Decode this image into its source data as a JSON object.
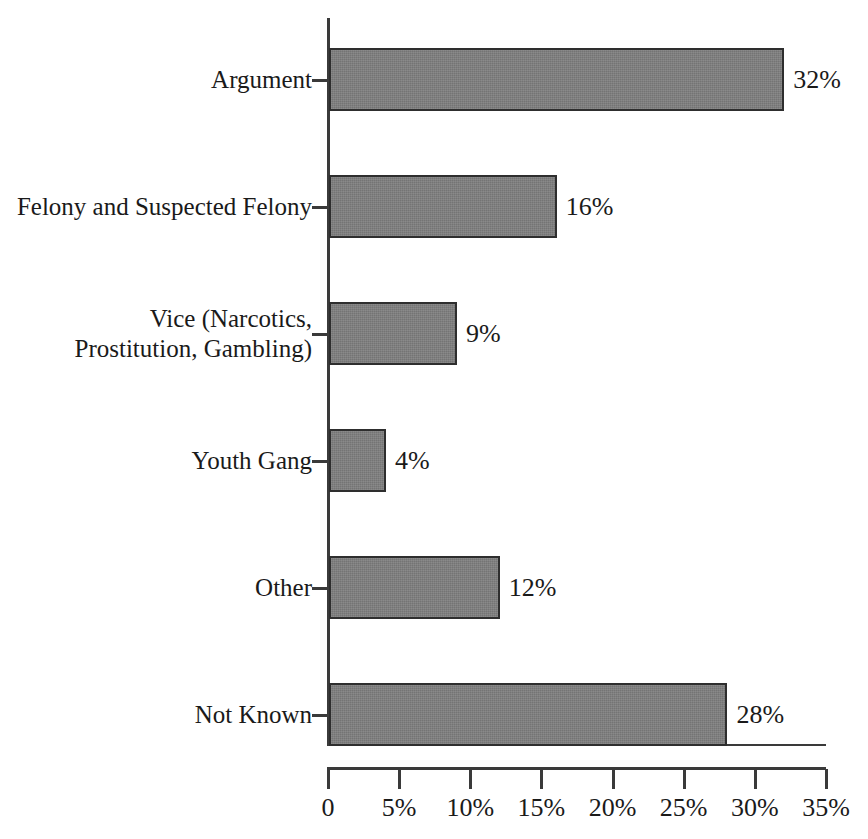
{
  "chart_data": {
    "type": "bar",
    "orientation": "horizontal",
    "title": "",
    "subtitle": "",
    "xlabel": "",
    "ylabel": "",
    "categories": [
      "Argument",
      "Felony and Suspected Felony",
      "Vice (Narcotics, Prostitution, Gambling)",
      "Youth Gang",
      "Other",
      "Not Known"
    ],
    "values": [
      32,
      16,
      9,
      4,
      12,
      28
    ],
    "value_labels": [
      "32%",
      "16%",
      "9%",
      "4%",
      "12%",
      "28%"
    ],
    "xlim": [
      0,
      35
    ],
    "xticks": [
      0,
      5,
      10,
      15,
      20,
      25,
      30,
      35
    ],
    "xtick_labels": [
      "0",
      "5%",
      "10%",
      "15%",
      "20%",
      "25%",
      "30%",
      "35%"
    ],
    "grid": false,
    "legend": false,
    "bar_color": "#7d7d7d",
    "bar_edge_color": "#2e2e2e",
    "axis_color": "#3a3a3a",
    "background_color": "#ffffff"
  },
  "bars": [
    {
      "label": "Argument",
      "label_line1": "Argument",
      "label_line2": "",
      "value": 32,
      "value_label": "32%"
    },
    {
      "label": "Felony and Suspected Felony",
      "label_line1": "Felony and Suspected Felony",
      "label_line2": "",
      "value": 16,
      "value_label": "16%"
    },
    {
      "label": "Vice (Narcotics, Prostitution, Gambling)",
      "label_line1": "Vice (Narcotics,",
      "label_line2": "Prostitution, Gambling)",
      "value": 9,
      "value_label": "9%"
    },
    {
      "label": "Youth Gang",
      "label_line1": "Youth Gang",
      "label_line2": "",
      "value": 4,
      "value_label": "4%"
    },
    {
      "label": "Other",
      "label_line1": "Other",
      "label_line2": "",
      "value": 12,
      "value_label": "12%"
    },
    {
      "label": "Not Known",
      "label_line1": "Not Known",
      "label_line2": "",
      "value": 28,
      "value_label": "28%"
    }
  ],
  "xaxis": {
    "ticks": [
      {
        "value": 0,
        "label": "0"
      },
      {
        "value": 5,
        "label": "5%"
      },
      {
        "value": 10,
        "label": "10%"
      },
      {
        "value": 15,
        "label": "15%"
      },
      {
        "value": 20,
        "label": "20%"
      },
      {
        "value": 25,
        "label": "25%"
      },
      {
        "value": 30,
        "label": "30%"
      },
      {
        "value": 35,
        "label": "35%"
      }
    ]
  }
}
